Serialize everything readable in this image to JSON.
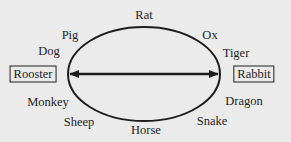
{
  "diagram": {
    "title": "",
    "center_arrow": "double-headed",
    "boxed": {
      "left": "Rooster",
      "right": "Rabbit"
    },
    "labels": {
      "rat": "Rat",
      "ox": "Ox",
      "tiger": "Tiger",
      "dragon": "Dragon",
      "snake": "Snake",
      "horse": "Horse",
      "sheep": "Sheep",
      "monkey": "Monkey",
      "dog": "Dog",
      "pig": "Pig"
    },
    "order_clockwise": [
      "Rat",
      "Ox",
      "Tiger",
      "Rabbit",
      "Dragon",
      "Snake",
      "Horse",
      "Sheep",
      "Monkey",
      "Rooster",
      "Dog",
      "Pig"
    ],
    "colors": {
      "background": "#ebebeb",
      "ink": "#1e1e1e"
    }
  }
}
